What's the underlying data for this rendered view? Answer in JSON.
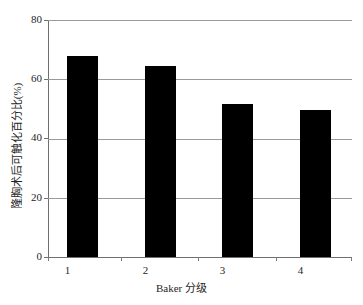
{
  "chart_data": {
    "type": "bar",
    "title": "",
    "subtitle": "",
    "xlabel": "Baker 分级",
    "ylabel": "隆胸术后可触化百分比(%)",
    "categories": [
      "1",
      "2",
      "3",
      "4"
    ],
    "values": [
      68,
      64.5,
      51.5,
      49.5
    ],
    "series": [
      {
        "name": "隆胸术后可触化百分比",
        "values": [
          68,
          64.5,
          51.5,
          49.5
        ]
      }
    ],
    "ylim": [
      0,
      80
    ],
    "yticks": [
      0,
      20,
      40,
      60,
      80
    ],
    "ytick_labels": [
      "0",
      "20",
      "40",
      "60",
      "80"
    ],
    "grid": "horizontal",
    "legend": "none",
    "bar_color": "#000000",
    "gridline_color": "#9a9a9a",
    "axis_color": "#6f6f6f",
    "background_color": "#ffffff"
  },
  "axes": {
    "y_title": "隆胸术后可触化百分比(%)",
    "x_title": "Baker 分级",
    "y_tick_labels": [
      "80",
      "60",
      "40",
      "20",
      "0"
    ],
    "x_tick_labels": [
      "1",
      "2",
      "3",
      "4"
    ]
  }
}
